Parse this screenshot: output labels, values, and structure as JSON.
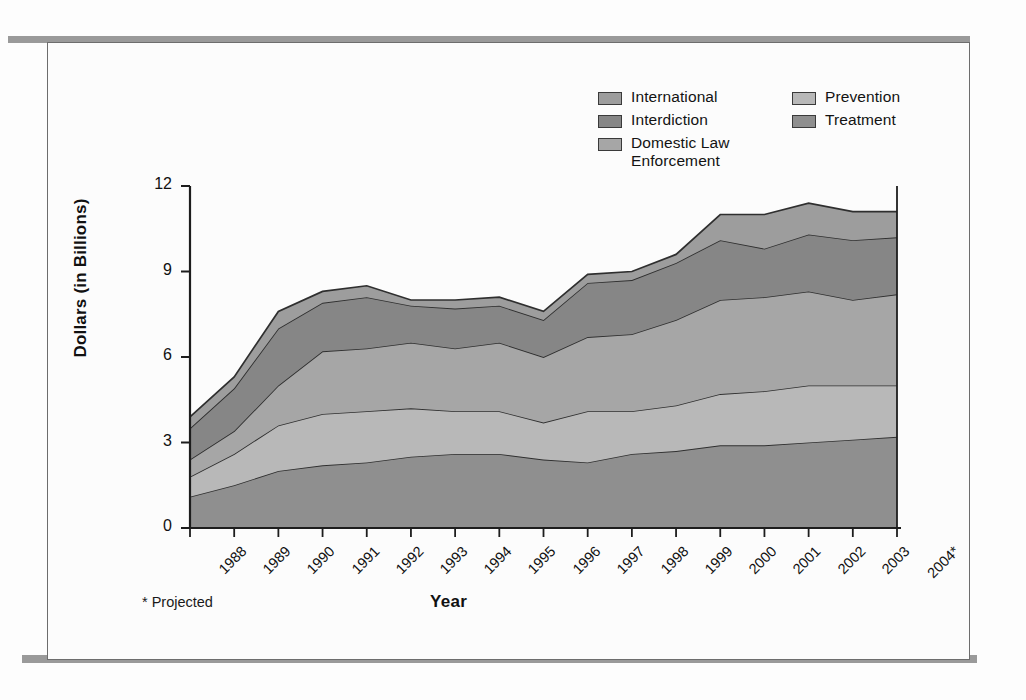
{
  "figure": {
    "ylabel": "Dollars (in Billions)",
    "xlabel": "Year",
    "footnote": "* Projected"
  },
  "legend": {
    "left_column": [
      {
        "label": "International",
        "color": "#9d9d9d",
        "key": "international"
      },
      {
        "label": "Interdiction",
        "color": "#868686",
        "key": "interdiction"
      },
      {
        "label": "Domestic Law\nEnforcement",
        "color": "#a6a6a6",
        "key": "domestic_law_enforcement"
      }
    ],
    "right_column": [
      {
        "label": "Prevention",
        "color": "#b8b8b8",
        "key": "prevention"
      },
      {
        "label": "Treatment",
        "color": "#8f8f8f",
        "key": "treatment"
      }
    ]
  },
  "chart_data": {
    "type": "area",
    "stacked": true,
    "title": "",
    "xlabel": "Year",
    "ylabel": "Dollars (in Billions)",
    "xlim": [
      1988,
      2004
    ],
    "ylim": [
      0,
      12
    ],
    "yticks": [
      0,
      3,
      6,
      9,
      12
    ],
    "grid": false,
    "legend_position": "top-right",
    "annotations": [
      "* Projected"
    ],
    "categories": [
      "1988",
      "1989",
      "1990",
      "1991",
      "1992",
      "1993",
      "1994",
      "1995",
      "1996",
      "1997",
      "1998",
      "1999",
      "2000",
      "2001",
      "2002",
      "2003",
      "2004*"
    ],
    "tick_labels": [
      "1988",
      "1989",
      "1990",
      "1991",
      "1992",
      "1993",
      "1994",
      "1995",
      "1996",
      "1997",
      "1998",
      "1999",
      "2000",
      "2001",
      "2002",
      "2003",
      "2004*"
    ],
    "series": [
      {
        "name": "Treatment",
        "color": "#8f8f8f",
        "values": [
          1.1,
          1.5,
          2.0,
          2.2,
          2.3,
          2.5,
          2.6,
          2.6,
          2.4,
          2.3,
          2.6,
          2.7,
          2.9,
          2.9,
          3.0,
          3.1,
          3.2
        ]
      },
      {
        "name": "Prevention",
        "color": "#b8b8b8",
        "values": [
          0.7,
          1.1,
          1.6,
          1.8,
          1.8,
          1.7,
          1.5,
          1.5,
          1.3,
          1.8,
          1.5,
          1.6,
          1.8,
          1.9,
          2.0,
          1.9,
          1.8
        ]
      },
      {
        "name": "Domestic Law Enforcement",
        "color": "#a6a6a6",
        "values": [
          0.6,
          0.8,
          1.4,
          2.2,
          2.2,
          2.3,
          2.2,
          2.4,
          2.3,
          2.6,
          2.7,
          3.0,
          3.3,
          3.3,
          3.3,
          3.0,
          3.2
        ]
      },
      {
        "name": "Interdiction",
        "color": "#868686",
        "values": [
          1.1,
          1.5,
          2.0,
          1.7,
          1.8,
          1.3,
          1.4,
          1.3,
          1.3,
          1.9,
          1.9,
          2.0,
          2.1,
          1.7,
          2.0,
          2.1,
          2.0
        ]
      },
      {
        "name": "International",
        "color": "#9d9d9d",
        "values": [
          0.4,
          0.4,
          0.6,
          0.4,
          0.4,
          0.2,
          0.3,
          0.3,
          0.3,
          0.3,
          0.3,
          0.3,
          0.9,
          1.2,
          1.1,
          1.0,
          0.9
        ]
      }
    ],
    "totals": [
      3.9,
      5.3,
      7.6,
      8.3,
      8.5,
      8.0,
      8.0,
      8.1,
      7.6,
      8.9,
      9.0,
      9.6,
      11.0,
      11.0,
      11.4,
      11.1,
      11.1
    ]
  }
}
